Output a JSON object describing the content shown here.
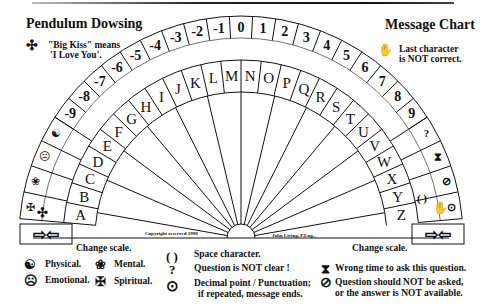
{
  "header": {
    "left_title": "Pendulum Dowsing",
    "right_title": "Message Chart",
    "big_kiss_note_line1": "\"Big Kiss\" means",
    "big_kiss_note_line2": "'I Love You'.",
    "last_char_note_line1": "Last character",
    "last_char_note_line2": "is NOT correct."
  },
  "fan": {
    "numbers": [
      "-9",
      "-8",
      "-7",
      "-6",
      "-5",
      "-4",
      "-3",
      "-2",
      "-1",
      "0",
      "1",
      "2",
      "3",
      "4",
      "5",
      "6",
      "7",
      "8",
      "9"
    ],
    "letters": [
      "A",
      "B",
      "C",
      "D",
      "E",
      "F",
      "G",
      "H",
      "I",
      "J",
      "K",
      "L",
      "M",
      "N",
      "O",
      "P",
      "Q",
      "R",
      "S",
      "T",
      "U",
      "V",
      "W",
      "X",
      "Y",
      "Z"
    ],
    "left_symbols": [
      "yin-yang",
      "sad-face",
      "flower",
      "cross"
    ],
    "right_symbols": [
      "?",
      "hourglass",
      "prohibited",
      "space-parens",
      "decimal-dot"
    ],
    "left_change_scale": "Change scale.",
    "right_change_scale": "Change scale.",
    "copyright": "Copyright reserved 1998",
    "author": "John Living, P.Eng.,"
  },
  "legend": {
    "physical": "Physical.",
    "emotional": "Emotional.",
    "mental": "Mental.",
    "spiritual": "Spiritual.",
    "space": "Space character.",
    "question": "Question is NOT clear !",
    "decimal_line1": "Decimal point / Punctuation;",
    "decimal_line2": "if repeated, message ends.",
    "wrong_time": "Wrong time to ask this question.",
    "should_not_line1": "Question should NOT be asked,",
    "should_not_line2": "or the answer is NOT available."
  },
  "icons": {
    "big_kiss": "✣",
    "hand": "✋",
    "space": "( )",
    "question": "?",
    "decimal": "⊙",
    "hourglass": "⧗",
    "prohibited": "⊘",
    "yin_yang": "☯",
    "sad": "☹",
    "mental": "❀",
    "spiritual": "✠",
    "arrows": "⇨⇦"
  }
}
